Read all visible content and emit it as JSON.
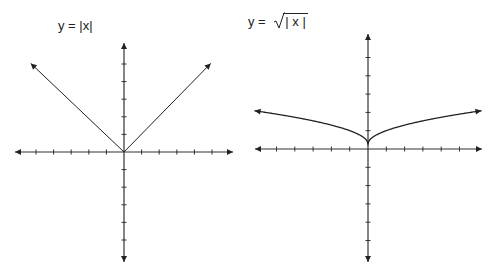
{
  "chart_data": [
    {
      "type": "line",
      "title": "y = |x|",
      "function": "abs(x)",
      "x": [
        -6,
        -5,
        -4,
        -3,
        -2,
        -1,
        0,
        1,
        2,
        3,
        4,
        5,
        6
      ],
      "values": [
        6,
        5,
        4,
        3,
        2,
        1,
        0,
        1,
        2,
        3,
        4,
        5,
        6
      ],
      "xlim": [
        -6,
        6
      ],
      "ylim": [
        -6,
        6
      ],
      "x_ticks": [
        -5,
        -4,
        -3,
        -2,
        -1,
        1,
        2,
        3,
        4,
        5
      ],
      "y_ticks": [
        -5,
        -4,
        -3,
        -2,
        -1,
        1,
        2,
        3,
        4,
        5
      ],
      "grid": false,
      "axis_arrows": true,
      "xlabel": "",
      "ylabel": ""
    },
    {
      "type": "line",
      "title_prefix": "y =",
      "title_radicand": "| x |",
      "title": "y = √|x|",
      "function": "sqrt(abs(x))",
      "x": [
        -6,
        -5,
        -4,
        -3,
        -2,
        -1,
        0,
        1,
        2,
        3,
        4,
        5,
        6
      ],
      "values": [
        2.45,
        2.24,
        2.0,
        1.73,
        1.41,
        1.0,
        0,
        1.0,
        1.41,
        1.73,
        2.0,
        2.24,
        2.45
      ],
      "xlim": [
        -6,
        6
      ],
      "ylim": [
        -6,
        6
      ],
      "x_ticks": [
        -5,
        -4,
        -3,
        -2,
        -1,
        1,
        2,
        3,
        4,
        5
      ],
      "y_ticks": [
        -5,
        -4,
        -3,
        -2,
        -1,
        1,
        2,
        3,
        4,
        5
      ],
      "grid": false,
      "axis_arrows": true,
      "xlabel": "",
      "ylabel": ""
    }
  ],
  "colors": {
    "axis": "#333333",
    "curve": "#222222"
  }
}
